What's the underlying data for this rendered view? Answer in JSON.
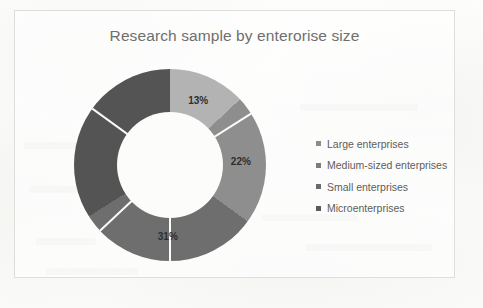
{
  "chart_data": {
    "type": "pie",
    "variant": "doughnut",
    "title": "Research sample by enterorise size",
    "categories": [
      "Large enterprises",
      "Medium-sized enterprises",
      "Small enterprises",
      "Microenterprises"
    ],
    "values": [
      13,
      22,
      31,
      34
    ],
    "value_labels": [
      "13%",
      "22%",
      "31%",
      ""
    ],
    "unit": "%",
    "colors": [
      "#b3b3b3",
      "#8e8e8e",
      "#6e6e6e",
      "#545454"
    ],
    "legend_position": "right",
    "grid": false,
    "xlabel": "",
    "ylabel": "",
    "start_angle_deg": 0,
    "direction": "clockwise"
  },
  "chart": {
    "title": "Research sample by enterorise size",
    "slices": [
      {
        "label": "Large enterprises",
        "value": 13,
        "display": "13%",
        "color": "#b3b3b3"
      },
      {
        "label": "Medium-sized enterprises",
        "value": 22,
        "display": "22%",
        "color": "#8e8e8e"
      },
      {
        "label": "Small enterprises",
        "value": 31,
        "display": "31%",
        "color": "#6e6e6e"
      },
      {
        "label": "Microenterprises",
        "value": 34,
        "display": "",
        "color": "#545454"
      }
    ],
    "legend": [
      {
        "label": "Large enterprises",
        "color": "#8c8c8c"
      },
      {
        "label": "Medium-sized enterprises",
        "color": "#7d7d7d"
      },
      {
        "label": "Small enterprises",
        "color": "#6b6b6b"
      },
      {
        "label": "Microenterprises",
        "color": "#5a5a5a"
      }
    ]
  },
  "caption": ""
}
